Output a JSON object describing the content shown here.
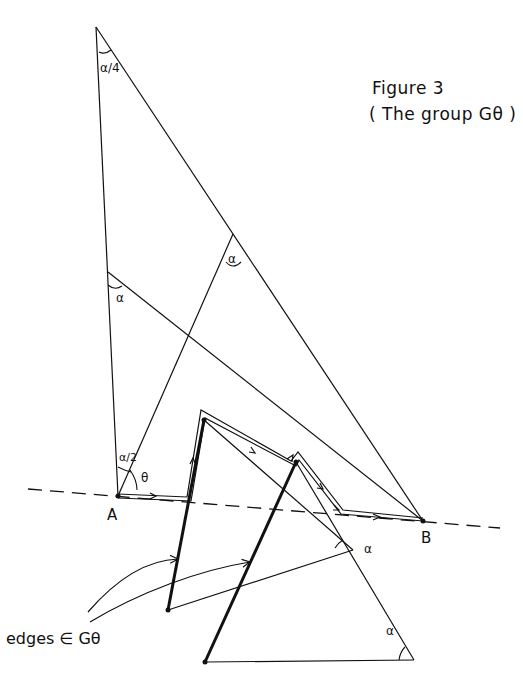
{
  "figure": {
    "title_line1": "Figure 3",
    "title_line2": "( The group  Gθ )"
  },
  "labels": {
    "point_a": "A",
    "point_b": "B",
    "apex_angle": "α/4",
    "angle_alpha_upper": "α",
    "angle_alpha_left": "α",
    "angle_alpha_half": "α/2",
    "angle_theta": "θ",
    "angle_alpha_tri1": "α",
    "angle_alpha_tri2": "α",
    "edges_caption": "edges ∈ Gθ"
  },
  "colors": {
    "ink": "#111111",
    "background": "#ffffff"
  }
}
